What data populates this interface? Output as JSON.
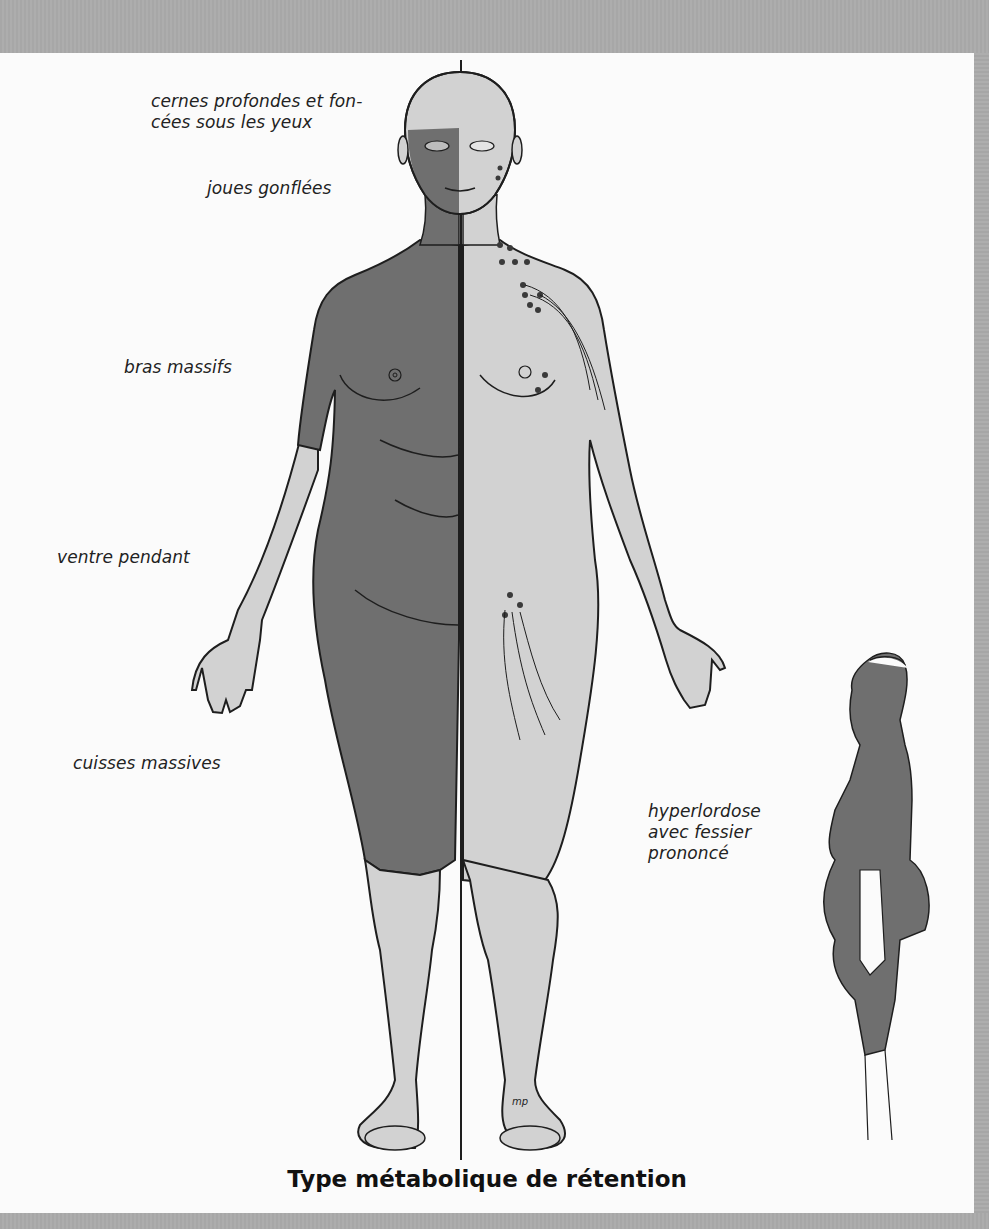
{
  "figure": {
    "title": "Type métabolique de rétention",
    "colors": {
      "frame": "#a9a9a9",
      "panel": "#fbfbfb",
      "retention_shade": "#6f6f6f",
      "skin_light": "#d2d2d2",
      "outline": "#1e1e1e"
    },
    "annotations": [
      {
        "id": "eyes",
        "text": "cernes profondes et fon-\ncées sous les yeux"
      },
      {
        "id": "cheeks",
        "text": "joues gonflées"
      },
      {
        "id": "arms",
        "text": "bras massifs"
      },
      {
        "id": "belly",
        "text": "ventre pendant"
      },
      {
        "id": "thighs",
        "text": "cuisses massives"
      },
      {
        "id": "posture",
        "text": "hyperlordose\navec fessier\nprononcé"
      }
    ],
    "illustrations": {
      "front_view": "front-body-figure",
      "side_view": "side-profile-figure",
      "signature": "mp"
    }
  }
}
